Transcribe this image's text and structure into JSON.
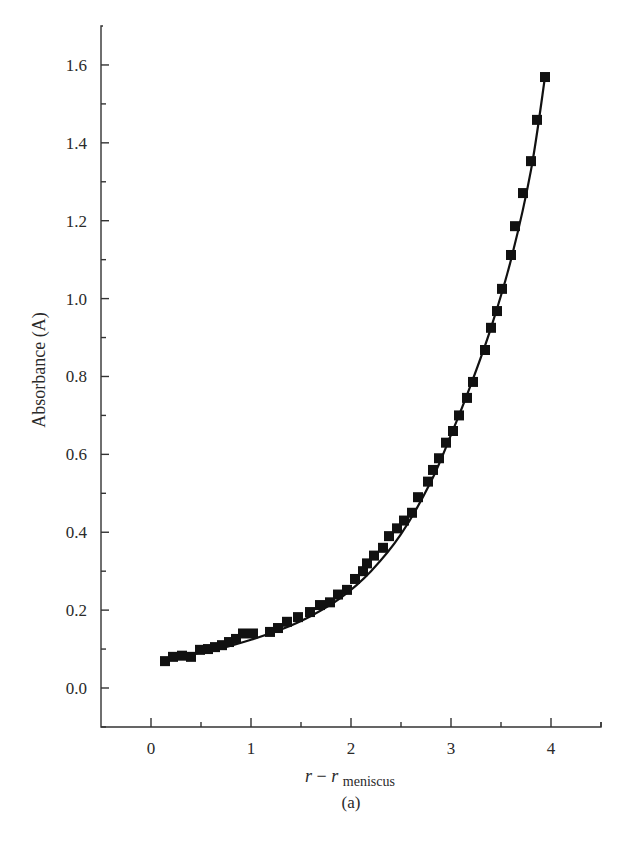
{
  "chart_data": {
    "type": "scatter",
    "title": "",
    "caption": "(a)",
    "xlabel": "r − r_meniscus",
    "xlabel_parts": {
      "main": "r − r",
      "subscript": "meniscus"
    },
    "ylabel": "Absorbance (A)",
    "xlim": [
      -0.5,
      4.5
    ],
    "ylim": [
      -0.1,
      1.7
    ],
    "x_ticks": [
      0,
      1,
      2,
      3,
      4
    ],
    "x_tick_labels": [
      "0",
      "1",
      "2",
      "3",
      "4"
    ],
    "x_minor_ticks": [
      0.5,
      1.5,
      2.5,
      3.5,
      4.5
    ],
    "y_ticks": [
      0.0,
      0.2,
      0.4,
      0.6,
      0.8,
      1.0,
      1.2,
      1.4,
      1.6
    ],
    "y_tick_labels": [
      "0.0",
      "0.2",
      "0.4",
      "0.6",
      "0.8",
      "1.0",
      "1.2",
      "1.4",
      "1.6"
    ],
    "y_minor_ticks": [
      -0.1,
      0.1,
      0.3,
      0.5,
      0.7,
      0.9,
      1.1,
      1.3,
      1.5
    ],
    "grid": false,
    "legend": null,
    "series": [
      {
        "name": "data",
        "marker": "square",
        "color": "#111111",
        "x": [
          0.14,
          0.22,
          0.31,
          0.4,
          0.49,
          0.57,
          0.64,
          0.71,
          0.78,
          0.85,
          0.92,
          1.02,
          1.19,
          1.27,
          1.36,
          1.47,
          1.59,
          1.69,
          1.79,
          1.87,
          1.96,
          2.04,
          2.12,
          2.16,
          2.23,
          2.32,
          2.38,
          2.46,
          2.53,
          2.61,
          2.67,
          2.77,
          2.82,
          2.88,
          2.95,
          3.02,
          3.08,
          3.16,
          3.22,
          3.34,
          3.4,
          3.46,
          3.51,
          3.6,
          3.64,
          3.72,
          3.8,
          3.86,
          3.94
        ],
        "y": [
          0.069,
          0.08,
          0.083,
          0.08,
          0.098,
          0.1,
          0.105,
          0.11,
          0.118,
          0.126,
          0.14,
          0.14,
          0.144,
          0.154,
          0.17,
          0.182,
          0.195,
          0.213,
          0.22,
          0.24,
          0.252,
          0.28,
          0.3,
          0.32,
          0.34,
          0.36,
          0.39,
          0.41,
          0.43,
          0.45,
          0.49,
          0.53,
          0.56,
          0.59,
          0.63,
          0.66,
          0.7,
          0.745,
          0.786,
          0.868,
          0.925,
          0.968,
          1.025,
          1.112,
          1.186,
          1.271,
          1.353,
          1.459,
          1.569
        ]
      },
      {
        "name": "fit",
        "line": "solid",
        "color": "#111111",
        "x": [
          0.14,
          0.4,
          0.7,
          1.0,
          1.3,
          1.6,
          1.9,
          2.2,
          2.5,
          2.8,
          3.0,
          3.2,
          3.4,
          3.6,
          3.8,
          3.94
        ],
        "y": [
          0.072,
          0.086,
          0.102,
          0.124,
          0.15,
          0.185,
          0.232,
          0.3,
          0.395,
          0.53,
          0.65,
          0.78,
          0.925,
          1.1,
          1.33,
          1.569
        ]
      }
    ]
  }
}
